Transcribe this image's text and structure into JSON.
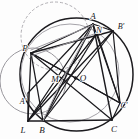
{
  "figure": {
    "width": 138,
    "height": 139,
    "background": "#fdfdfd"
  },
  "style": {
    "main_stroke": "#1b1a1e",
    "aux_stroke": "#8f8d93",
    "light_stroke": "#b3b1b6",
    "label_color": "#17161a",
    "point_fill": "#1b1a1e"
  },
  "circles": [
    {
      "name": "circumcircle",
      "cx": 76.5,
      "cy": 74.5,
      "r": 56.5,
      "stroke": "#1b1a1e",
      "width": 1.5,
      "dash": "none"
    },
    {
      "name": "left-auxiliary-circle",
      "cx": 33.0,
      "cy": 81.0,
      "r": 33.0,
      "stroke": "#9a989e",
      "width": 1.0,
      "dash": "none"
    },
    {
      "name": "upper-left-dashed-circle",
      "cx": 55.0,
      "cy": 36.0,
      "r": 34.0,
      "stroke": "#b0aeb3",
      "width": 1.0,
      "dash": "3,2"
    },
    {
      "name": "inner-auxiliary-circle",
      "cx": 70.0,
      "cy": 73.0,
      "r": 49.0,
      "stroke": "#a5a3a9",
      "width": 1.0,
      "dash": "none"
    }
  ],
  "points": [
    {
      "name": "A",
      "label": "A",
      "x": 93.0,
      "y": 24.0,
      "lx": 93.0,
      "ly": 19.0,
      "anchor": "middle",
      "dot": false
    },
    {
      "name": "B",
      "label": "B",
      "x": 43.0,
      "y": 121.0,
      "lx": 42.0,
      "ly": 133.0,
      "anchor": "middle",
      "dot": false
    },
    {
      "name": "C",
      "label": "C",
      "x": 112.0,
      "y": 120.0,
      "lx": 114.0,
      "ly": 132.0,
      "anchor": "middle",
      "dot": false
    },
    {
      "name": "Aprime",
      "label": "A'",
      "x": 28.0,
      "y": 93.0,
      "lx": 23.0,
      "ly": 104.0,
      "anchor": "middle",
      "dot": false
    },
    {
      "name": "Bprime",
      "label": "B'",
      "x": 113.0,
      "y": 31.0,
      "lx": 121.0,
      "ly": 29.0,
      "anchor": "middle",
      "dot": false
    },
    {
      "name": "Cprime",
      "label": "C'",
      "x": 120.0,
      "y": 103.0,
      "lx": 124.0,
      "ly": 108.0,
      "anchor": "middle",
      "dot": false
    },
    {
      "name": "P",
      "label": "P",
      "x": 31.0,
      "y": 53.0,
      "lx": 25.0,
      "ly": 51.0,
      "anchor": "middle",
      "dot": false
    },
    {
      "name": "L",
      "label": "L",
      "x": 28.0,
      "y": 121.0,
      "lx": 23.0,
      "ly": 133.0,
      "anchor": "middle",
      "dot": false
    },
    {
      "name": "M",
      "label": "M",
      "x": 62.0,
      "y": 80.0,
      "lx": 55.0,
      "ly": 82.0,
      "anchor": "middle",
      "dot": false
    },
    {
      "name": "N",
      "label": "N",
      "x": 97.0,
      "y": 33.0,
      "lx": 99.0,
      "ly": 33.0,
      "anchor": "middle",
      "dot": false
    },
    {
      "name": "O",
      "label": "O",
      "x": 75.5,
      "y": 78.0,
      "lx": 83.0,
      "ly": 81.0,
      "anchor": "middle",
      "dot": true
    }
  ],
  "segments": [
    {
      "name": "side-AB",
      "x1": 93.0,
      "y1": 24.0,
      "x2": 43.0,
      "y2": 121.0,
      "stroke": "#1b1a1e",
      "width": 1.4
    },
    {
      "name": "side-BC",
      "x1": 43.0,
      "y1": 121.0,
      "x2": 112.0,
      "y2": 120.0,
      "stroke": "#1b1a1e",
      "width": 1.4
    },
    {
      "name": "side-CA",
      "x1": 112.0,
      "y1": 120.0,
      "x2": 93.0,
      "y2": 24.0,
      "stroke": "#1b1a1e",
      "width": 1.4
    },
    {
      "name": "chord-P-Bprime",
      "x1": 31.0,
      "y1": 53.0,
      "x2": 113.0,
      "y2": 31.0,
      "stroke": "#1b1a1e",
      "width": 1.3
    },
    {
      "name": "chord-P-Cprime",
      "x1": 31.0,
      "y1": 53.0,
      "x2": 120.0,
      "y2": 103.0,
      "stroke": "#1b1a1e",
      "width": 1.3
    },
    {
      "name": "chord-P-A",
      "x1": 31.0,
      "y1": 53.0,
      "x2": 93.0,
      "y2": 24.0,
      "stroke": "#1b1a1e",
      "width": 1.2
    },
    {
      "name": "chord-P-B",
      "x1": 31.0,
      "y1": 53.0,
      "x2": 43.0,
      "y2": 121.0,
      "stroke": "#1b1a1e",
      "width": 1.3
    },
    {
      "name": "chord-P-C",
      "x1": 31.0,
      "y1": 53.0,
      "x2": 112.0,
      "y2": 120.0,
      "stroke": "#1b1a1e",
      "width": 1.2
    },
    {
      "name": "segment-P-L",
      "x1": 31.0,
      "y1": 53.0,
      "x2": 28.0,
      "y2": 121.0,
      "stroke": "#1b1a1e",
      "width": 1.3
    },
    {
      "name": "segment-L-B",
      "x1": 28.0,
      "y1": 121.0,
      "x2": 43.0,
      "y2": 121.0,
      "stroke": "#1b1a1e",
      "width": 1.4
    },
    {
      "name": "segment-L-A",
      "x1": 28.0,
      "y1": 121.0,
      "x2": 93.0,
      "y2": 24.0,
      "stroke": "#1b1a1e",
      "width": 1.3
    },
    {
      "name": "segment-L-Bprime",
      "x1": 28.0,
      "y1": 121.0,
      "x2": 113.0,
      "y2": 31.0,
      "stroke": "#1b1a1e",
      "width": 1.3
    },
    {
      "name": "segment-L-N",
      "x1": 28.0,
      "y1": 121.0,
      "x2": 97.0,
      "y2": 33.0,
      "stroke": "#1b1a1e",
      "width": 1.1
    },
    {
      "name": "segment-B-A",
      "x1": 43.0,
      "y1": 121.0,
      "x2": 97.0,
      "y2": 33.0,
      "stroke": "#1b1a1e",
      "width": 1.2
    },
    {
      "name": "segment-B-Bprime",
      "x1": 43.0,
      "y1": 121.0,
      "x2": 113.0,
      "y2": 31.0,
      "stroke": "#1b1a1e",
      "width": 1.2
    },
    {
      "name": "segment-A-Cprime",
      "x1": 93.0,
      "y1": 24.0,
      "x2": 120.0,
      "y2": 103.0,
      "stroke": "#1b1a1e",
      "width": 1.2
    },
    {
      "name": "segment-N-Cprime",
      "x1": 97.0,
      "y1": 33.0,
      "x2": 120.0,
      "y2": 103.0,
      "stroke": "#1b1a1e",
      "width": 1.1
    },
    {
      "name": "segment-A-Bprime",
      "x1": 93.0,
      "y1": 24.0,
      "x2": 113.0,
      "y2": 31.0,
      "stroke": "#1b1a1e",
      "width": 1.2
    },
    {
      "name": "segment-Bprime-Cprime",
      "x1": 113.0,
      "y1": 31.0,
      "x2": 120.0,
      "y2": 103.0,
      "stroke": "#1b1a1e",
      "width": 1.2
    },
    {
      "name": "segment-Cprime-C",
      "x1": 120.0,
      "y1": 103.0,
      "x2": 112.0,
      "y2": 120.0,
      "stroke": "#1b1a1e",
      "width": 1.2
    },
    {
      "name": "segment-Aprime-L",
      "x1": 28.0,
      "y1": 93.0,
      "x2": 28.0,
      "y2": 121.0,
      "stroke": "#1b1a1e",
      "width": 1.2
    },
    {
      "name": "segment-Aprime-A",
      "x1": 28.0,
      "y1": 93.0,
      "x2": 93.0,
      "y2": 24.0,
      "stroke": "#1b1a1e",
      "width": 1.2
    },
    {
      "name": "diagonal-M-Cprime",
      "x1": 31.0,
      "y1": 53.0,
      "x2": 120.0,
      "y2": 103.0,
      "stroke": "#1b1a1e",
      "width": 1.2
    },
    {
      "name": "segment-A-B-through-M",
      "x1": 97.0,
      "y1": 33.0,
      "x2": 28.0,
      "y2": 121.0,
      "stroke": "#1b1a1e",
      "width": 1.2
    },
    {
      "name": "light-chord-P-A-upper",
      "x1": 31.0,
      "y1": 50.0,
      "x2": 93.0,
      "y2": 25.0,
      "stroke": "#9d9ba1",
      "width": 1.0
    },
    {
      "name": "light-chord-P-N",
      "x1": 31.0,
      "y1": 56.0,
      "x2": 97.0,
      "y2": 33.0,
      "stroke": "#9d9ba1",
      "width": 1.0
    },
    {
      "name": "light-chord-A-M",
      "x1": 93.0,
      "y1": 24.0,
      "x2": 62.0,
      "y2": 80.0,
      "stroke": "#a09ea4",
      "width": 1.0
    },
    {
      "name": "light-chord-M-B",
      "x1": 62.0,
      "y1": 80.0,
      "x2": 43.0,
      "y2": 121.0,
      "stroke": "#a09ea4",
      "width": 1.0
    }
  ]
}
